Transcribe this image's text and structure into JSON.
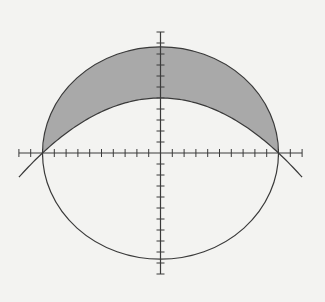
{
  "diagram": {
    "type": "region-between-curves",
    "curves": [
      {
        "name": "circle",
        "equation": "x^2 + y^2 = 100",
        "radius": 10
      },
      {
        "name": "parabola",
        "equation": "y = 5 - x^2/20",
        "vertex": [
          0,
          5
        ],
        "x_intercepts": [
          -10,
          10
        ]
      }
    ],
    "shaded_region": "between upper arc of circle and parabola for -10 <= x <= 10",
    "intersection_points": [
      [
        -10,
        0
      ],
      [
        10,
        0
      ]
    ],
    "axes": {
      "x_range": [
        -12,
        12
      ],
      "y_range": [
        -11,
        11
      ],
      "tick_spacing": 1,
      "labels": false
    },
    "colors": {
      "background": "#f3f3f1",
      "stroke": "#3a3a3a",
      "shade": "#a9a9a9"
    }
  }
}
